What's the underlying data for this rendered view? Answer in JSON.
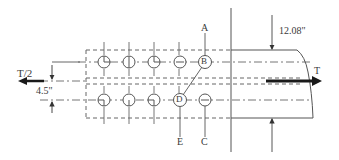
{
  "diagram": {
    "type": "bolted splice plate connection",
    "labels": {
      "left_load": "T/2",
      "right_load": "T",
      "plate_width": "12.08\"",
      "row_spacing": "4.5\"",
      "point_a": "A",
      "point_b": "B",
      "point_c": "C",
      "point_d": "D",
      "point_e": "E"
    },
    "bolt_rows": [
      {
        "name": "upper",
        "bolts": [
          "bolt",
          "bolt",
          "bolt",
          "bolt",
          "B"
        ]
      },
      {
        "name": "lower",
        "bolts": [
          "bolt",
          "bolt",
          "bolt",
          "D",
          "bolt"
        ]
      }
    ],
    "colors": {
      "line": "#555555",
      "arrow": "#1a1a1a",
      "background": "#ffffff"
    }
  }
}
